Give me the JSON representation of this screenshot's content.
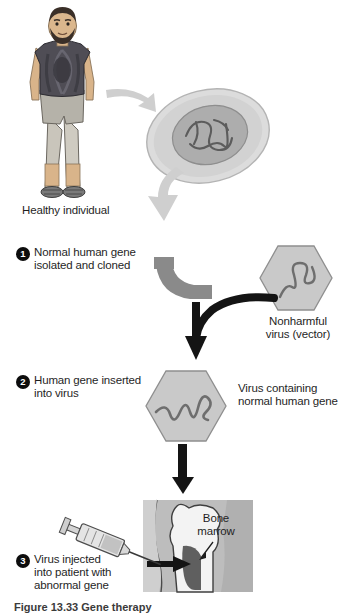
{
  "figure": {
    "caption": "Figure 13.33  Gene therapy"
  },
  "labels": {
    "healthy_individual": "Healthy individual",
    "nonharmful_virus": "Nonharmful\nvirus (vector)",
    "virus_containing_gene": "Virus containing\nnormal human gene",
    "bone_marrow": "Bone\nmarrow"
  },
  "steps": [
    {
      "number": "1",
      "text": "Normal human gene\nisolated and cloned"
    },
    {
      "number": "2",
      "text": "Human gene inserted\ninto virus"
    },
    {
      "number": "3",
      "text": "Virus injected\ninto patient with\nabnormal gene"
    }
  ],
  "colors": {
    "background": "#ffffff",
    "text": "#1f1f1f",
    "badge_fill": "#0d0d0d",
    "badge_text": "#ffffff",
    "hexagon_fill": "#c9c9c9",
    "hexagon_stroke": "#8f8f8f",
    "gene_strand": "#6e6e6e",
    "arrow_light_gray": "#cfcfcf",
    "arrow_mid_gray": "#8a8a8a",
    "arrow_black": "#141414",
    "cell_cytoplasm": "#d8d8d8",
    "cell_nucleus": "#a9a9a9",
    "dna_strand": "#5a5a5a",
    "skin": "#d9b48a",
    "hair": "#3a2f28",
    "shirt": "#4a4a52",
    "shorts": "#b3b3ad",
    "bone_panel_bg": "#bdbdbd",
    "bone_fill": "#f2f2f2",
    "marrow_fill": "#5f5f5f",
    "syringe_body": "#e2e2e2",
    "syringe_outline": "#4d4d4d"
  }
}
